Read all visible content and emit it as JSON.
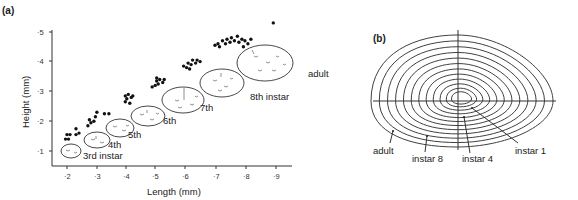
{
  "chart_data": [
    {
      "panel": "(a)",
      "type": "scatter",
      "xlabel": "Length (mm)",
      "ylabel": "Height (mm)",
      "xticks": [
        "2",
        "3",
        "4",
        "5",
        "6",
        "7",
        "8",
        "9"
      ],
      "yticks": [
        "1",
        "2",
        "3",
        "4",
        "5"
      ],
      "xlim": [
        1.6,
        10
      ],
      "ylim": [
        0.5,
        5.2
      ],
      "grid": false,
      "legend": null,
      "annotations": [
        "3rd instar",
        "4th",
        "5th",
        "6th",
        "7th",
        "8th instar",
        "adult"
      ],
      "series": [
        {
          "name": "3rd instar",
          "points": [
            [
              1.95,
              1.4
            ],
            [
              2.05,
              1.4
            ],
            [
              2.0,
              1.55
            ],
            [
              2.1,
              1.55
            ],
            [
              2.3,
              1.55
            ],
            [
              2.4,
              1.6
            ],
            [
              2.3,
              1.75
            ]
          ]
        },
        {
          "name": "4th instar",
          "points": [
            [
              2.7,
              1.85
            ],
            [
              2.8,
              1.95
            ],
            [
              2.75,
              2.05
            ],
            [
              2.9,
              2.0
            ],
            [
              2.95,
              2.15
            ],
            [
              3.0,
              2.3
            ],
            [
              3.25,
              2.25
            ],
            [
              3.4,
              2.25
            ]
          ]
        },
        {
          "name": "5th instar",
          "points": [
            [
              3.95,
              2.65
            ],
            [
              4.1,
              2.6
            ],
            [
              4.0,
              2.75
            ],
            [
              4.15,
              2.8
            ],
            [
              4.05,
              2.9
            ],
            [
              4.2,
              2.85
            ],
            [
              3.95,
              2.85
            ]
          ]
        },
        {
          "name": "6th instar",
          "points": [
            [
              4.85,
              3.15
            ],
            [
              4.95,
              3.2
            ],
            [
              5.05,
              3.25
            ],
            [
              5.0,
              3.35
            ],
            [
              5.1,
              3.4
            ],
            [
              5.2,
              3.3
            ],
            [
              5.25,
              3.4
            ],
            [
              5.0,
              3.45
            ]
          ]
        },
        {
          "name": "7th instar",
          "points": [
            [
              5.9,
              3.85
            ],
            [
              6.0,
              3.8
            ],
            [
              6.05,
              3.95
            ],
            [
              6.15,
              3.9
            ],
            [
              6.2,
              4.05
            ],
            [
              6.3,
              3.95
            ],
            [
              6.35,
              4.05
            ],
            [
              6.45,
              4.0
            ],
            [
              6.1,
              3.75
            ]
          ]
        },
        {
          "name": "8th instar / adult",
          "points": [
            [
              6.95,
              4.55
            ],
            [
              7.05,
              4.6
            ],
            [
              7.1,
              4.5
            ],
            [
              7.2,
              4.7
            ],
            [
              7.3,
              4.6
            ],
            [
              7.35,
              4.75
            ],
            [
              7.45,
              4.65
            ],
            [
              7.5,
              4.8
            ],
            [
              7.6,
              4.7
            ],
            [
              7.7,
              4.85
            ],
            [
              7.75,
              4.65
            ],
            [
              7.85,
              4.75
            ],
            [
              7.95,
              4.7
            ],
            [
              8.05,
              4.6
            ],
            [
              8.15,
              4.75
            ],
            [
              7.9,
              4.5
            ],
            [
              8.9,
              5.3
            ]
          ]
        }
      ],
      "shells": [
        {
          "label": "3rd instar",
          "center": [
            2.15,
            1.05
          ],
          "size": [
            0.65,
            0.45
          ]
        },
        {
          "label": "4th",
          "center": [
            2.95,
            1.4
          ],
          "size": [
            0.85,
            0.5
          ]
        },
        {
          "label": "5th",
          "center": [
            3.75,
            1.75
          ],
          "size": [
            0.95,
            0.55
          ]
        },
        {
          "label": "6th",
          "center": [
            4.7,
            2.15
          ],
          "size": [
            1.15,
            0.65
          ]
        },
        {
          "label": "7th",
          "center": [
            5.85,
            2.7
          ],
          "size": [
            1.4,
            0.85
          ]
        },
        {
          "label": "8th instar",
          "center": [
            7.15,
            3.25
          ],
          "size": [
            1.5,
            0.95
          ]
        },
        {
          "label": "adult",
          "center": [
            8.55,
            3.95
          ],
          "size": [
            1.9,
            1.2
          ]
        }
      ]
    },
    {
      "panel": "(b)",
      "type": "diagram",
      "title": "Growth outlines superimposed (instar 1 to adult)",
      "annotations": [
        "adult",
        "instar 8",
        "instar 4",
        "instar 1"
      ],
      "contour_count": 12
    }
  ],
  "panel_a": {
    "label": "(a)",
    "xlabel": "Length (mm)",
    "ylabel": "Height (mm)",
    "xticks": [
      "·2",
      "·3",
      "·4",
      "·5",
      "·6",
      "·7",
      "·8",
      "·9"
    ],
    "yticks": [
      "·1",
      "·2",
      "·3",
      "·4",
      "·5"
    ],
    "labels": {
      "l3": "3rd instar",
      "l4": "4th",
      "l5": "5th",
      "l6": "6th",
      "l7": "7th",
      "l8": "8th instar",
      "adult": "adult"
    }
  },
  "panel_b": {
    "label": "(b)",
    "labels": {
      "adult": "adult",
      "instar8": "instar 8",
      "instar4": "instar 4",
      "instar1": "instar 1"
    }
  }
}
